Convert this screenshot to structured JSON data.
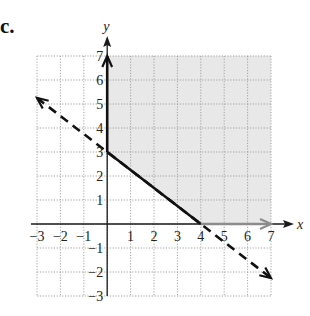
{
  "header": {
    "clipped_text": "            ",
    "part_label": "c."
  },
  "colors": {
    "shade": "#e8e8e8",
    "grid": "#9a9a9a",
    "axis": "#1a1a1a",
    "boundary": "#111111",
    "x_axis_ray": "#8c8c8c"
  },
  "chart_data": {
    "type": "line",
    "title": "",
    "xlabel": "x",
    "ylabel": "y",
    "xlim": [
      -3,
      7
    ],
    "ylim": [
      -3,
      7
    ],
    "grid": true,
    "x_ticks": [
      "-3",
      "-2",
      "-1",
      "1",
      "2",
      "3",
      "4",
      "5",
      "6",
      "7"
    ],
    "y_ticks": [
      "7",
      "6",
      "5",
      "4",
      "3",
      "2",
      "1",
      "-1",
      "-2",
      "-3"
    ],
    "series": [
      {
        "name": "dashed line y = -3/4 x + 3",
        "style": "dashed",
        "x": [
          -3,
          7
        ],
        "y": [
          5.25,
          -2.25
        ],
        "arrows": "both"
      },
      {
        "name": "solid boundary segment",
        "style": "solid",
        "x": [
          0,
          4
        ],
        "y": [
          3,
          0
        ]
      },
      {
        "name": "solid boundary on y-axis",
        "style": "solid",
        "x": [
          0,
          0
        ],
        "y": [
          3,
          7
        ],
        "arrows": "end"
      },
      {
        "name": "boundary on x-axis (gray)",
        "style": "solid",
        "x": [
          4,
          7
        ],
        "y": [
          0,
          0
        ],
        "arrows": "end"
      }
    ],
    "shaded_region": {
      "description": "x >= 0, y >= 0, y >= -3/4 x + 3",
      "vertices": [
        [
          0,
          3
        ],
        [
          4,
          0
        ],
        [
          7,
          0
        ],
        [
          7,
          7
        ],
        [
          0,
          7
        ]
      ]
    }
  }
}
